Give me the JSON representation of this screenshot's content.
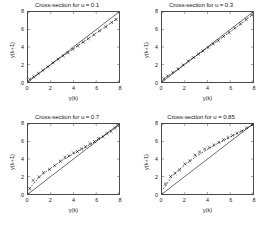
{
  "figure": {
    "background_color": "#ffffff",
    "layout": "2x2 subplot grid",
    "width": 269,
    "height": 225
  },
  "chart_data": [
    {
      "type": "scatter",
      "title": "Cross-section for u = 0.1",
      "xlabel": "y(k)",
      "ylabel": "y(k+1)",
      "xlim": [
        0,
        8
      ],
      "ylim": [
        0,
        8
      ],
      "xticks": [
        0,
        2,
        4,
        6,
        8
      ],
      "yticks": [
        0,
        2,
        4,
        6,
        8
      ],
      "grid": false,
      "legend": "none",
      "series": [
        {
          "name": "identity line",
          "style": "solid",
          "color": "#000000",
          "x": [
            0,
            8
          ],
          "y": [
            0,
            8
          ]
        },
        {
          "name": "model fit",
          "style": "dashed",
          "color": "#000000",
          "x": [
            0.15,
            1.0,
            2.0,
            3.0,
            4.0,
            5.0,
            6.0,
            7.0,
            7.75
          ],
          "y": [
            0.3,
            1.05,
            2.0,
            2.9,
            3.8,
            4.7,
            5.6,
            6.5,
            7.15
          ]
        },
        {
          "name": "data points",
          "style": "marker-x",
          "color": "#000000",
          "x": [
            0.15,
            0.5,
            0.9,
            1.3,
            1.75,
            2.2,
            2.65,
            3.1,
            3.5,
            3.95,
            4.4,
            4.85,
            5.3,
            5.8,
            6.3,
            6.85,
            7.35,
            7.75
          ],
          "y": [
            0.3,
            0.6,
            0.98,
            1.35,
            1.75,
            2.2,
            2.6,
            3.0,
            3.35,
            3.75,
            4.15,
            4.55,
            4.95,
            5.4,
            5.85,
            6.3,
            6.8,
            7.15
          ]
        }
      ]
    },
    {
      "type": "scatter",
      "title": "Cross-section for u = 0.3",
      "xlabel": "y(k)",
      "ylabel": "y(k+1)",
      "xlim": [
        0,
        8
      ],
      "ylim": [
        0,
        8
      ],
      "xticks": [
        0,
        2,
        4,
        6,
        8
      ],
      "yticks": [
        0,
        2,
        4,
        6,
        8
      ],
      "grid": false,
      "legend": "none",
      "series": [
        {
          "name": "identity line",
          "style": "solid",
          "color": "#000000",
          "x": [
            0,
            8
          ],
          "y": [
            0,
            8
          ]
        },
        {
          "name": "model fit",
          "style": "dashed",
          "color": "#000000",
          "x": [
            0.15,
            1.0,
            2.0,
            3.0,
            4.0,
            5.0,
            6.0,
            7.0,
            7.9
          ],
          "y": [
            0.35,
            1.1,
            2.05,
            3.0,
            3.9,
            4.8,
            5.75,
            6.7,
            7.65
          ]
        },
        {
          "name": "data points",
          "style": "marker-x",
          "color": "#000000",
          "x": [
            0.15,
            0.5,
            0.95,
            1.4,
            1.85,
            2.3,
            2.75,
            3.2,
            3.6,
            4.05,
            4.5,
            4.95,
            5.4,
            5.9,
            6.4,
            6.9,
            7.4,
            7.9
          ],
          "y": [
            0.35,
            0.7,
            1.1,
            1.5,
            1.95,
            2.4,
            2.8,
            3.2,
            3.55,
            3.95,
            4.35,
            4.75,
            5.2,
            5.65,
            6.15,
            6.65,
            7.15,
            7.65
          ]
        }
      ]
    },
    {
      "type": "scatter",
      "title": "Cross-section for u = 0.7",
      "xlabel": "y(k)",
      "ylabel": "y(k+1)",
      "xlim": [
        0,
        8
      ],
      "ylim": [
        0,
        8
      ],
      "xticks": [
        0,
        2,
        4,
        6,
        8
      ],
      "yticks": [
        0,
        2,
        4,
        6,
        8
      ],
      "grid": false,
      "legend": "none",
      "series": [
        {
          "name": "identity line",
          "style": "solid",
          "color": "#000000",
          "x": [
            0,
            8
          ],
          "y": [
            0,
            8
          ]
        },
        {
          "name": "model fit",
          "style": "dashed",
          "color": "#000000",
          "x": [
            0.1,
            1.0,
            2.0,
            3.0,
            4.0,
            5.0,
            6.0,
            7.0,
            7.9
          ],
          "y": [
            0.6,
            1.95,
            2.95,
            3.85,
            4.6,
            5.3,
            6.1,
            6.95,
            7.8
          ]
        },
        {
          "name": "data points",
          "style": "marker-x",
          "color": "#000000",
          "x": [
            0.15,
            0.45,
            0.95,
            1.35,
            1.9,
            2.35,
            2.85,
            3.25,
            3.6,
            4.0,
            4.35,
            4.7,
            5.05,
            5.45,
            5.85,
            6.2,
            6.6,
            6.95,
            7.3,
            7.65,
            7.9
          ],
          "y": [
            0.6,
            1.55,
            1.95,
            2.45,
            2.8,
            3.25,
            3.75,
            4.2,
            4.35,
            4.7,
            4.85,
            5.15,
            5.4,
            5.75,
            6.0,
            6.35,
            6.55,
            6.9,
            7.15,
            7.5,
            7.8
          ]
        }
      ]
    },
    {
      "type": "scatter",
      "title": "Cross-section for u = 0.85",
      "xlabel": "y(k)",
      "ylabel": "y(k+1)",
      "xlim": [
        0,
        8
      ],
      "ylim": [
        0,
        8
      ],
      "xticks": [
        0,
        2,
        4,
        6,
        8
      ],
      "yticks": [
        0,
        2,
        4,
        6,
        8
      ],
      "grid": false,
      "legend": "none",
      "series": [
        {
          "name": "identity line",
          "style": "solid",
          "color": "#000000",
          "x": [
            0,
            8
          ],
          "y": [
            0,
            8
          ]
        },
        {
          "name": "model fit",
          "style": "dashed",
          "color": "#000000",
          "x": [
            0.1,
            1.0,
            2.0,
            3.0,
            4.0,
            5.0,
            6.0,
            7.0,
            7.95
          ],
          "y": [
            0.55,
            2.25,
            3.3,
            4.3,
            5.1,
            5.85,
            6.5,
            7.2,
            7.9
          ]
        },
        {
          "name": "data points",
          "style": "marker-x",
          "color": "#000000",
          "x": [
            0.3,
            0.75,
            1.15,
            1.55,
            2.0,
            2.45,
            2.9,
            3.3,
            3.75,
            4.15,
            4.55,
            5.0,
            5.4,
            5.8,
            6.2,
            6.6,
            7.0,
            7.45,
            7.9
          ],
          "y": [
            1.15,
            2.0,
            2.35,
            2.75,
            3.45,
            3.8,
            4.45,
            4.8,
            5.15,
            5.3,
            5.6,
            5.9,
            6.2,
            6.45,
            6.7,
            6.95,
            7.2,
            7.55,
            7.9
          ]
        }
      ]
    }
  ]
}
